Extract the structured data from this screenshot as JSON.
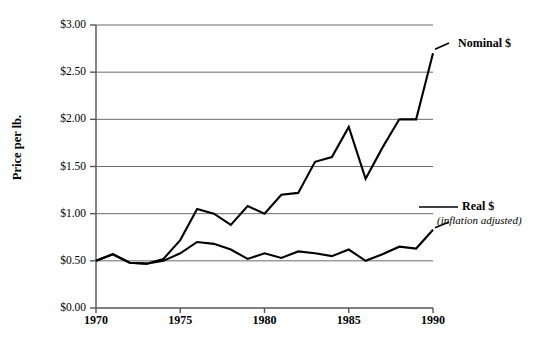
{
  "chart_data": {
    "type": "line",
    "title": "",
    "title_note": "title cropped off top edge of screenshot (illegible)",
    "xlabel": "",
    "ylabel": "Price per lb.",
    "xlim": [
      1970,
      1990
    ],
    "ylim": [
      0.0,
      3.0
    ],
    "grid": true,
    "legend_position": "right-inline-annotations",
    "x": [
      1970,
      1971,
      1972,
      1973,
      1974,
      1975,
      1976,
      1977,
      1978,
      1979,
      1980,
      1981,
      1982,
      1983,
      1984,
      1985,
      1986,
      1987,
      1988,
      1989,
      1990
    ],
    "xtick_labels": [
      "1970",
      "1975",
      "1980",
      "1985",
      "1990"
    ],
    "xtick_values": [
      1970,
      1975,
      1980,
      1985,
      1990
    ],
    "ytick_labels": [
      "$0.00",
      "$0.50",
      "$1.00",
      "$1.50",
      "$2.00",
      "$2.50",
      "$3.00"
    ],
    "ytick_values": [
      0.0,
      0.5,
      1.0,
      1.5,
      2.0,
      2.5,
      3.0
    ],
    "series": [
      {
        "name": "Nominal $",
        "label": "Nominal $",
        "sublabel": "",
        "color": "#000000",
        "values": [
          0.5,
          0.57,
          0.48,
          0.47,
          0.52,
          0.72,
          1.05,
          1.0,
          0.88,
          1.08,
          1.0,
          1.2,
          1.22,
          1.55,
          1.6,
          1.92,
          1.37,
          1.7,
          2.0,
          2.0,
          2.7
        ]
      },
      {
        "name": "Real $",
        "label": "Real $",
        "sublabel": "(inflation adjusted)",
        "color": "#000000",
        "values": [
          0.5,
          0.57,
          0.48,
          0.47,
          0.5,
          0.58,
          0.7,
          0.68,
          0.62,
          0.52,
          0.58,
          0.53,
          0.6,
          0.58,
          0.55,
          0.62,
          0.5,
          0.57,
          0.65,
          0.63,
          0.83
        ]
      }
    ]
  },
  "axis": {
    "y_title": "Price per lb."
  },
  "annotations": {
    "nominal_label": "Nominal $",
    "real_label": "Real $",
    "real_sublabel": "(inflation adjusted)"
  }
}
